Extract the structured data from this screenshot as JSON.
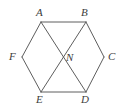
{
  "figure": {
    "background_color": "#ffffff",
    "stroke_color": "#5e5e5e",
    "stroke_width": 1,
    "label_color": "#3d3d3d",
    "width": 128,
    "height": 112,
    "points": {
      "A": {
        "name": "A",
        "x": 41,
        "y": 22,
        "label_x": 36,
        "label_y": 7
      },
      "B": {
        "name": "B",
        "x": 86,
        "y": 22,
        "label_x": 81,
        "label_y": 7
      },
      "C": {
        "name": "C",
        "x": 104,
        "y": 57,
        "label_x": 108,
        "label_y": 51
      },
      "D": {
        "name": "D",
        "x": 86,
        "y": 92,
        "label_x": 81,
        "label_y": 94
      },
      "E": {
        "name": "E",
        "x": 41,
        "y": 92,
        "label_x": 36,
        "label_y": 94
      },
      "F": {
        "name": "F",
        "x": 22,
        "y": 57,
        "label_x": 9,
        "label_y": 51
      },
      "N": {
        "name": "N",
        "x": 63,
        "y": 57,
        "label_x": 66,
        "label_y": 52
      }
    },
    "edges": [
      {
        "name": "edge-AB",
        "from": "A",
        "to": "B",
        "kind": "hexagon-side"
      },
      {
        "name": "edge-BC",
        "from": "B",
        "to": "C",
        "kind": "hexagon-side"
      },
      {
        "name": "edge-CD",
        "from": "C",
        "to": "D",
        "kind": "hexagon-side"
      },
      {
        "name": "edge-DE",
        "from": "D",
        "to": "E",
        "kind": "hexagon-side"
      },
      {
        "name": "edge-EF",
        "from": "E",
        "to": "F",
        "kind": "hexagon-side"
      },
      {
        "name": "edge-FA",
        "from": "F",
        "to": "A",
        "kind": "hexagon-side"
      },
      {
        "name": "diagonal-AD",
        "from": "A",
        "to": "D",
        "kind": "diagonal"
      },
      {
        "name": "diagonal-BE",
        "from": "B",
        "to": "E",
        "kind": "diagonal"
      }
    ]
  }
}
